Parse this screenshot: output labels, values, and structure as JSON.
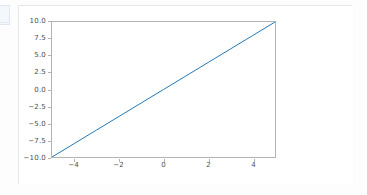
{
  "window": {
    "background_color": "#fdfdfe",
    "card_border_color": "#e3e8ee"
  },
  "left_fragment": {
    "name": "clipped-panel-edge",
    "color": "#dfe8f0"
  },
  "chart_data": {
    "type": "line",
    "title": "",
    "xlabel": "",
    "ylabel": "",
    "xlim": [
      -5,
      5
    ],
    "ylim": [
      -10,
      10
    ],
    "grid": false,
    "legend": null,
    "line_color": "#1f77b4",
    "line_width": 1,
    "axis_color": "#b3b3b3",
    "tick_label_color": "#4d4d4d",
    "series": [
      {
        "name": "y = 2x",
        "x": [
          -5,
          -4,
          -3,
          -2,
          -1,
          0,
          1,
          2,
          3,
          4,
          5
        ],
        "values": [
          -10,
          -8,
          -6,
          -4,
          -2,
          0,
          2,
          4,
          6,
          8,
          10
        ]
      }
    ],
    "yticks": [
      10.0,
      7.5,
      5.0,
      2.5,
      0.0,
      -2.5,
      -5.0,
      -7.5,
      -10.0
    ],
    "ytick_labels": [
      "10.0",
      "7.5",
      "5.0",
      "2.5",
      "0.0",
      "−2.5",
      "−5.0",
      "−7.5",
      "−10.0"
    ],
    "xticks": [
      -4,
      -2,
      0,
      2,
      4
    ],
    "xtick_labels": [
      "−4",
      "−2",
      "0",
      "2",
      "4"
    ]
  }
}
